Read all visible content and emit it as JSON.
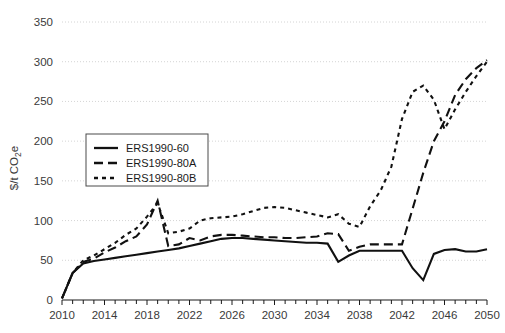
{
  "chart_data": {
    "type": "line",
    "title": "",
    "subtitle": "",
    "xlabel": "",
    "ylabel": "$/t CO2e",
    "ylabel_display": "$/t CO",
    "ylabel_sub": "2",
    "ylabel_tail": "e",
    "xlim": [
      2010,
      2050
    ],
    "ylim": [
      0,
      350
    ],
    "ytick_step": 50,
    "xtick_step": 4,
    "x_minor_tick_step": 1,
    "grid": true,
    "grid_axis": "y",
    "legend_position": "upper left",
    "yticks": [
      0,
      50,
      100,
      150,
      200,
      250,
      300,
      350
    ],
    "ytick_labels": [
      "0",
      "50",
      "100",
      "150",
      "200",
      "250",
      "300",
      "350"
    ],
    "xticks": [
      2010,
      2014,
      2018,
      2022,
      2026,
      2030,
      2034,
      2038,
      2042,
      2046,
      2050
    ],
    "xtick_labels": [
      "2010",
      "2014",
      "2018",
      "2022",
      "2026",
      "2030",
      "2034",
      "2038",
      "2042",
      "2046",
      "2050"
    ],
    "colors": {
      "line": "#111111",
      "grid": "#c9c9c9",
      "axis": "#1a1a1a",
      "background": "#ffffff"
    },
    "series": [
      {
        "name": "ERS1990-60",
        "style": "solid",
        "dash": "none",
        "x": [
          2010,
          2011,
          2012,
          2013,
          2014,
          2015,
          2016,
          2017,
          2018,
          2019,
          2020,
          2021,
          2022,
          2023,
          2024,
          2025,
          2026,
          2027,
          2028,
          2029,
          2030,
          2031,
          2032,
          2033,
          2034,
          2035,
          2036,
          2037,
          2038,
          2039,
          2040,
          2041,
          2042,
          2043,
          2044,
          2045,
          2046,
          2047,
          2048,
          2049,
          2050
        ],
        "y": [
          2,
          34,
          46,
          49,
          51,
          53,
          55,
          57,
          59,
          61,
          63,
          65,
          68,
          71,
          74,
          77,
          78,
          78,
          77,
          76,
          75,
          74,
          73,
          72,
          72,
          71,
          48,
          56,
          62,
          62,
          62,
          62,
          62,
          40,
          25,
          58,
          63,
          64,
          61,
          61,
          64
        ]
      },
      {
        "name": "ERS1990-80A",
        "style": "dashed",
        "dash": "9 5",
        "x": [
          2010,
          2011,
          2012,
          2013,
          2014,
          2015,
          2016,
          2017,
          2018,
          2019,
          2020,
          2021,
          2022,
          2023,
          2024,
          2025,
          2026,
          2027,
          2028,
          2029,
          2030,
          2031,
          2032,
          2033,
          2034,
          2035,
          2036,
          2037,
          2038,
          2039,
          2040,
          2041,
          2042,
          2043,
          2044,
          2045,
          2046,
          2047,
          2048,
          2049,
          2050
        ],
        "y": [
          2,
          34,
          48,
          52,
          60,
          66,
          74,
          80,
          95,
          125,
          68,
          70,
          78,
          75,
          80,
          82,
          82,
          81,
          80,
          79,
          79,
          78,
          78,
          79,
          80,
          84,
          83,
          62,
          67,
          70,
          70,
          70,
          70,
          115,
          160,
          200,
          225,
          258,
          278,
          292,
          302
        ]
      },
      {
        "name": "ERS1990-80B",
        "style": "dotted",
        "dash": "4 4",
        "x": [
          2010,
          2011,
          2012,
          2013,
          2014,
          2015,
          2016,
          2017,
          2018,
          2019,
          2020,
          2021,
          2022,
          2023,
          2024,
          2025,
          2026,
          2027,
          2028,
          2029,
          2030,
          2031,
          2032,
          2033,
          2034,
          2035,
          2036,
          2037,
          2038,
          2039,
          2040,
          2041,
          2042,
          2043,
          2044,
          2045,
          2046,
          2047,
          2048,
          2049,
          2050
        ],
        "y": [
          2,
          34,
          50,
          56,
          64,
          72,
          82,
          90,
          105,
          122,
          84,
          86,
          90,
          100,
          103,
          104,
          105,
          108,
          112,
          116,
          117,
          116,
          113,
          110,
          107,
          104,
          108,
          96,
          92,
          118,
          138,
          168,
          228,
          262,
          270,
          252,
          215,
          240,
          262,
          282,
          300
        ]
      }
    ]
  },
  "legend": {
    "items": [
      {
        "label": "ERS1990-60",
        "style": "solid"
      },
      {
        "label": "ERS1990-80A",
        "style": "dashed"
      },
      {
        "label": "ERS1990-80B",
        "style": "dotted"
      }
    ]
  }
}
